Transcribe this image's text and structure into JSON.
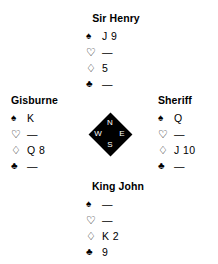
{
  "diagram": {
    "type": "bridge-hand-diagram",
    "compass": {
      "north_label": "N",
      "west_label": "W",
      "east_label": "E",
      "south_label": "S",
      "color": "#000000",
      "letter_color": "#ffffff"
    },
    "suit_symbols": {
      "spade": "♠",
      "heart": "♡",
      "diamond": "♢",
      "club": "♣"
    },
    "void_mark": "—",
    "hands": {
      "north": {
        "name": "Sir Henry",
        "spades": "J 9",
        "hearts": "—",
        "diamonds": "5",
        "clubs": "—"
      },
      "west": {
        "name": "Gisburne",
        "spades": "K",
        "hearts": "—",
        "diamonds": "Q 8",
        "clubs": "—"
      },
      "east": {
        "name": "Sheriff",
        "spades": "Q",
        "hearts": "—",
        "diamonds": "J 10",
        "clubs": "—"
      },
      "south": {
        "name": "King John",
        "spades": "—",
        "hearts": "—",
        "diamonds": "K 2",
        "clubs": "9"
      }
    }
  }
}
